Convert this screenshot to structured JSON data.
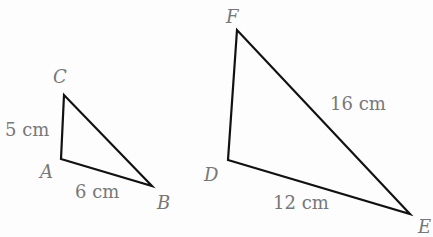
{
  "triangles": [
    {
      "name": "ABC",
      "vertices": {
        "A": [
          61,
          159
        ],
        "B": [
          152,
          186
        ],
        "C": [
          64,
          95
        ]
      },
      "vertex_labels": {
        "A": "A",
        "B": "B",
        "C": "C"
      },
      "side_labels": {
        "AC": "5 cm",
        "AB": "6 cm"
      }
    },
    {
      "name": "DEF",
      "vertices": {
        "D": [
          228,
          160
        ],
        "E": [
          410,
          214
        ],
        "F": [
          237,
          30
        ]
      },
      "vertex_labels": {
        "D": "D",
        "E": "E",
        "F": "F"
      },
      "side_labels": {
        "FE": "16 cm",
        "DE": "12 cm"
      }
    }
  ],
  "colors": {
    "stroke": "#111111",
    "label": "#777777",
    "background": "#fdfdfd"
  }
}
